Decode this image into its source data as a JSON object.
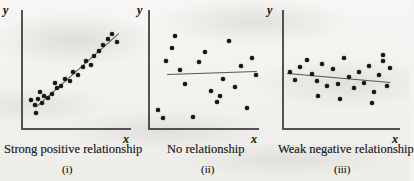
{
  "figure": {
    "background_color": "#f4f3f1",
    "ink_color": "#161514",
    "axis_color": "#55514c",
    "point_color": "#161514"
  },
  "chart_data": [
    {
      "type": "scatter",
      "title": "Strong positive relationship",
      "subtitle": "(i)",
      "xlabel": "x",
      "ylabel": "y",
      "grid": false,
      "legend": "none",
      "xlim": [
        0,
        100
      ],
      "ylim": [
        0,
        100
      ],
      "relationship": "strong positive",
      "trend_line": {
        "x0": 16,
        "y0": 21,
        "x1": 84,
        "y1": 87
      },
      "x": [
        18,
        16,
        20,
        22,
        19,
        24,
        21,
        26,
        30,
        34,
        33,
        38,
        42,
        46,
        49,
        53,
        57,
        60,
        64,
        67,
        71,
        75,
        79,
        82,
        86
      ],
      "y": [
        20,
        24,
        26,
        22,
        11,
        28,
        32,
        25,
        30,
        36,
        41,
        38,
        45,
        43,
        52,
        49,
        57,
        63,
        59,
        68,
        72,
        78,
        84,
        89,
        80
      ]
    },
    {
      "type": "scatter",
      "title": "No relationship",
      "subtitle": "(ii)",
      "xlabel": "x",
      "ylabel": "y",
      "grid": false,
      "legend": "none",
      "xlim": [
        0,
        100
      ],
      "ylim": [
        0,
        100
      ],
      "relationship": "none",
      "trend_line": {
        "x0": 20,
        "y0": 54,
        "x1": 98,
        "y1": 56
      },
      "x": [
        10,
        14,
        23,
        28,
        31,
        38,
        42,
        46,
        50,
        54,
        58,
        62,
        66,
        70,
        74,
        78,
        82,
        86,
        90,
        94,
        98,
        35,
        60,
        20
      ],
      "y": [
        22,
        14,
        78,
        55,
        41,
        12,
        62,
        72,
        34,
        24,
        45,
        85,
        38,
        58,
        18,
        68,
        50,
        28,
        76,
        60,
        40,
        88,
        30,
        66
      ]
    },
    {
      "type": "scatter",
      "title": "Weak negative relationship",
      "subtitle": "(iii)",
      "xlabel": "x",
      "ylabel": "y",
      "grid": false,
      "legend": "none",
      "xlim": [
        0,
        100
      ],
      "ylim": [
        0,
        100
      ],
      "relationship": "weak negative",
      "trend_line": {
        "x0": 6,
        "y0": 56,
        "x1": 98,
        "y1": 44
      },
      "x": [
        8,
        12,
        16,
        22,
        26,
        30,
        34,
        38,
        43,
        47,
        52,
        56,
        60,
        64,
        68,
        72,
        76,
        80,
        84,
        88,
        92,
        96,
        18,
        50,
        82
      ],
      "y": [
        58,
        50,
        63,
        70,
        55,
        48,
        66,
        42,
        60,
        45,
        72,
        52,
        40,
        58,
        46,
        64,
        38,
        55,
        68,
        44,
        61,
        50,
        44,
        36,
        30
      ]
    }
  ],
  "panels": [
    {
      "id": "panel-i",
      "caption": "Strong positive relationship",
      "roman_numeral": "(i)",
      "x_axis_label": "x",
      "y_axis_label": "y"
    },
    {
      "id": "panel-ii",
      "caption": "No relationship",
      "roman_numeral": "(ii)",
      "x_axis_label": "x",
      "y_axis_label": "y"
    },
    {
      "id": "panel-iii",
      "caption": "Weak negative relationship",
      "roman_numeral": "(iii)",
      "x_axis_label": "x",
      "y_axis_label": "y"
    }
  ],
  "points_px": {
    "panel_i": [
      [
        35,
        105
      ],
      [
        31,
        100
      ],
      [
        38,
        99
      ],
      [
        42,
        103
      ],
      [
        36,
        113
      ],
      [
        44,
        96
      ],
      [
        40,
        92
      ],
      [
        48,
        98
      ],
      [
        52,
        94
      ],
      [
        57,
        88
      ],
      [
        55,
        83
      ],
      [
        61,
        86
      ],
      [
        65,
        79
      ],
      [
        70,
        81
      ],
      [
        73,
        72
      ],
      [
        78,
        75
      ],
      [
        83,
        67
      ],
      [
        86,
        61
      ],
      [
        91,
        65
      ],
      [
        94,
        56
      ],
      [
        99,
        51
      ],
      [
        103,
        45
      ],
      [
        108,
        39
      ],
      [
        112,
        34
      ],
      [
        117,
        42
      ]
    ],
    "panel_ii": [
      [
        158,
        110
      ],
      [
        163,
        118
      ],
      [
        172,
        48
      ],
      [
        180,
        70
      ],
      [
        185,
        84
      ],
      [
        193,
        117
      ],
      [
        199,
        62
      ],
      [
        205,
        52
      ],
      [
        211,
        91
      ],
      [
        217,
        102
      ],
      [
        223,
        79
      ],
      [
        229,
        41
      ],
      [
        235,
        87
      ],
      [
        241,
        66
      ],
      [
        247,
        108
      ],
      [
        252,
        58
      ],
      [
        256,
        75
      ],
      [
        175,
        36
      ],
      [
        220,
        96
      ],
      [
        166,
        61
      ]
    ],
    "panel_iii": [
      [
        290,
        72
      ],
      [
        295,
        80
      ],
      [
        300,
        67
      ],
      [
        307,
        60
      ],
      [
        312,
        74
      ],
      [
        317,
        81
      ],
      [
        322,
        64
      ],
      [
        327,
        86
      ],
      [
        333,
        69
      ],
      [
        338,
        84
      ],
      [
        344,
        58
      ],
      [
        349,
        77
      ],
      [
        354,
        88
      ],
      [
        359,
        72
      ],
      [
        364,
        83
      ],
      [
        369,
        66
      ],
      [
        374,
        92
      ],
      [
        379,
        75
      ],
      [
        383,
        61
      ],
      [
        387,
        86
      ],
      [
        390,
        68
      ],
      [
        372,
        103
      ],
      [
        340,
        99
      ],
      [
        318,
        96
      ],
      [
        383,
        55
      ]
    ]
  },
  "trend_lines_px": {
    "panel_i": {
      "x0": 37,
      "y0": 106,
      "x1": 119,
      "y1": 33
    },
    "panel_ii": {
      "x0": 167,
      "y0": 74,
      "x1": 257,
      "y1": 71
    },
    "panel_iii": {
      "x0": 287,
      "y0": 73,
      "x1": 391,
      "y1": 82
    }
  },
  "axes_px": {
    "panel_i": {
      "vx": 21,
      "vy0": 10,
      "vy1": 129,
      "hx0": 21,
      "hx1": 131,
      "hy": 128,
      "ylabel_x": 3,
      "ylabel_y": 4,
      "xlabel_x": 123,
      "xlabel_y": 133
    },
    "panel_ii": {
      "vx": 148,
      "vy0": 10,
      "vy1": 129,
      "hx0": 148,
      "hx1": 259,
      "hy": 128,
      "ylabel_x": 137,
      "ylabel_y": 4,
      "xlabel_x": 251,
      "xlabel_y": 133
    },
    "panel_iii": {
      "vx": 282,
      "vy0": 10,
      "vy1": 129,
      "hx0": 282,
      "hx1": 400,
      "hy": 128,
      "ylabel_x": 267,
      "ylabel_y": 4,
      "xlabel_x": 392,
      "xlabel_y": 133
    }
  },
  "captions_px": {
    "panel_i": {
      "caption_x": 4,
      "caption_y": 143,
      "roman_x": 62,
      "roman_y": 164
    },
    "panel_ii": {
      "caption_x": 167,
      "caption_y": 143,
      "roman_x": 201,
      "roman_y": 164
    },
    "panel_iii": {
      "caption_x": 278,
      "caption_y": 143,
      "roman_x": 334,
      "roman_y": 164
    }
  }
}
